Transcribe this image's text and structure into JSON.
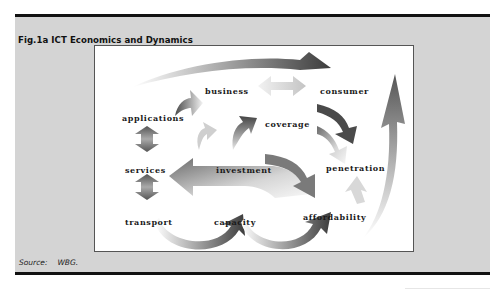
{
  "figure": {
    "title": "Fig.1a ICT Economics and Dynamics",
    "source_label": "Source:",
    "source_value": "WBG."
  },
  "diagram": {
    "nodes": [
      {
        "id": "business",
        "label": "business"
      },
      {
        "id": "consumer",
        "label": "consumer"
      },
      {
        "id": "applications",
        "label": "applications"
      },
      {
        "id": "coverage",
        "label": "coverage"
      },
      {
        "id": "services",
        "label": "services"
      },
      {
        "id": "investment",
        "label": "investment"
      },
      {
        "id": "penetration",
        "label": "penetration"
      },
      {
        "id": "transport",
        "label": "transport"
      },
      {
        "id": "capacity",
        "label": "capacity"
      },
      {
        "id": "affordability",
        "label": "affordability"
      }
    ],
    "arrows": [
      {
        "name": "top-swoosh-arrow",
        "from": "applications",
        "to": "consumer"
      },
      {
        "name": "business-consumer-double-arrow",
        "from": "business",
        "to": "consumer",
        "bidirectional": true
      },
      {
        "name": "applications-business-arrow",
        "from": "applications",
        "to": "business"
      },
      {
        "name": "applications-services-double-arrow",
        "from": "applications",
        "to": "services",
        "bidirectional": true
      },
      {
        "name": "services-transport-double-arrow",
        "from": "services",
        "to": "transport",
        "bidirectional": true
      },
      {
        "name": "investment-business-arrow",
        "from": "investment",
        "to": "business"
      },
      {
        "name": "investment-coverage-arrow",
        "from": "investment",
        "to": "coverage"
      },
      {
        "name": "consumer-penetration-arrow",
        "from": "consumer",
        "to": "penetration"
      },
      {
        "name": "coverage-penetration-arrow",
        "from": "coverage",
        "to": "penetration"
      },
      {
        "name": "affordability-penetration-arrow",
        "from": "affordability",
        "to": "penetration"
      },
      {
        "name": "capacity-investment-arrow",
        "from": "capacity",
        "to": "investment"
      },
      {
        "name": "investment-affordability-arrow",
        "from": "investment",
        "to": "affordability"
      },
      {
        "name": "transport-capacity-loop-arrow",
        "from": "transport",
        "to": "capacity"
      },
      {
        "name": "capacity-affordability-loop-arrow",
        "from": "capacity",
        "to": "affordability"
      },
      {
        "name": "right-rising-arrow",
        "from": "affordability",
        "to": "consumer"
      }
    ]
  }
}
